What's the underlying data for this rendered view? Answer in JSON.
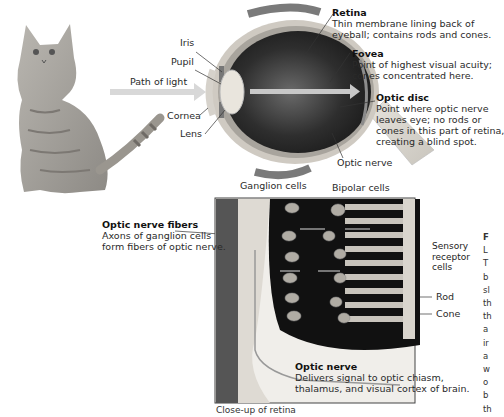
{
  "figure": {
    "eye_labels": {
      "iris": "Iris",
      "pupil": "Pupil",
      "cornea": "Cornea",
      "lens": "Lens",
      "path_of_light": "Path of light",
      "optic_nerve": "Optic nerve"
    },
    "retina": {
      "title": "Retina",
      "desc": [
        "Thin membrane lining back of",
        "eyeball; contains rods and cones."
      ]
    },
    "fovea": {
      "title": "Fovea",
      "desc": [
        "Point of highest visual acuity;",
        "cones concentrated here."
      ]
    },
    "optic_disc": {
      "title": "Optic disc",
      "desc": [
        "Point where optic nerve",
        "leaves eye; no rods or",
        "cones in this part of retina,",
        "creating a blind spot."
      ]
    },
    "closeup_labels": {
      "ganglion": "Ganglion cells",
      "bipolar": "Bipolar cells",
      "sensory": [
        "Sensory",
        "receptor",
        "cells"
      ],
      "rod": "Rod",
      "cone": "Cone"
    },
    "optic_nerve_fibers": {
      "title": "Optic nerve fibers",
      "desc": [
        "Axons of ganglion cells",
        "form fibers of optic nerve."
      ]
    },
    "optic_nerve_closeup": {
      "title": "Optic nerve",
      "desc": [
        "Delivers signal to optic chiasm,",
        "thalamus, and visual cortex of brain."
      ]
    },
    "caption": "Close-up of retina",
    "side_column": {
      "heading": "F",
      "lines": [
        "L",
        "T",
        "b",
        "sl",
        "th",
        "th",
        "a",
        "ir",
        "a",
        "w",
        "o",
        "b",
        "th"
      ]
    }
  }
}
